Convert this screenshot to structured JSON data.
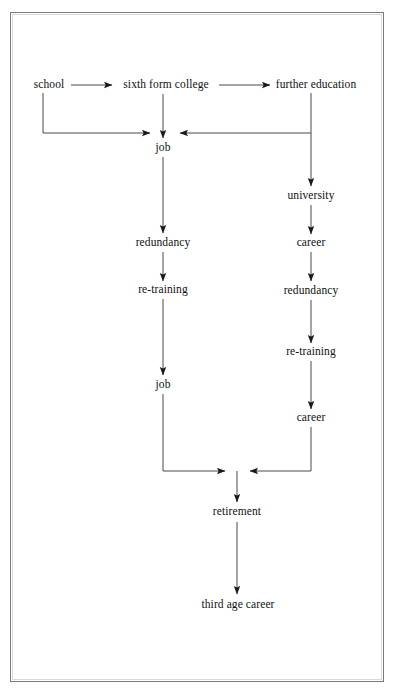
{
  "diagram": {
    "type": "flowchart",
    "background_color": "#ffffff",
    "border_color": "#7a7a7a",
    "line_color": "#222222",
    "text_color": "#111111",
    "nodes": [
      {
        "id": "school",
        "label": "school",
        "x": 49,
        "y": 85
      },
      {
        "id": "sixth-form",
        "label": "sixth form college",
        "x": 166,
        "y": 85
      },
      {
        "id": "further-education",
        "label": "further education",
        "x": 316,
        "y": 85
      },
      {
        "id": "job-1",
        "label": "job",
        "x": 163,
        "y": 148
      },
      {
        "id": "university",
        "label": "university",
        "x": 311,
        "y": 196
      },
      {
        "id": "redundancy-1",
        "label": "redundancy",
        "x": 163,
        "y": 243
      },
      {
        "id": "career-1",
        "label": "career",
        "x": 311,
        "y": 243
      },
      {
        "id": "re-training-1",
        "label": "re-training",
        "x": 163,
        "y": 290
      },
      {
        "id": "redundancy-2",
        "label": "redundancy",
        "x": 311,
        "y": 291
      },
      {
        "id": "re-training-2",
        "label": "re-training",
        "x": 311,
        "y": 352
      },
      {
        "id": "job-2",
        "label": "job",
        "x": 163,
        "y": 385
      },
      {
        "id": "career-2",
        "label": "career",
        "x": 311,
        "y": 418
      },
      {
        "id": "retirement",
        "label": "retirement",
        "x": 237,
        "y": 512
      },
      {
        "id": "third-age-career",
        "label": "third age career",
        "x": 238,
        "y": 605
      }
    ],
    "edges": [
      {
        "id": "school-to-sixth-form",
        "from": "school",
        "to": "sixth-form",
        "kind": "horizontal-right"
      },
      {
        "id": "sixth-form-to-further-education",
        "from": "sixth-form",
        "to": "further-education",
        "kind": "horizontal-right"
      },
      {
        "id": "school-to-job",
        "from": "school",
        "to": "job-1",
        "kind": "down-then-right"
      },
      {
        "id": "sixth-form-to-job",
        "from": "sixth-form",
        "to": "job-1",
        "kind": "vertical-down"
      },
      {
        "id": "further-education-to-job",
        "from": "further-education",
        "to": "job-1",
        "kind": "down-then-left"
      },
      {
        "id": "further-education-to-university",
        "from": "further-education",
        "to": "university",
        "kind": "vertical-down"
      },
      {
        "id": "job-to-redundancy",
        "from": "job-1",
        "to": "redundancy-1",
        "kind": "vertical-down"
      },
      {
        "id": "redundancy-to-re-training",
        "from": "redundancy-1",
        "to": "re-training-1",
        "kind": "vertical-down"
      },
      {
        "id": "re-training-to-job",
        "from": "re-training-1",
        "to": "job-2",
        "kind": "vertical-down"
      },
      {
        "id": "university-to-career",
        "from": "university",
        "to": "career-1",
        "kind": "vertical-down"
      },
      {
        "id": "career-to-redundancy",
        "from": "career-1",
        "to": "redundancy-2",
        "kind": "vertical-down"
      },
      {
        "id": "redundancy-to-re-training-right",
        "from": "redundancy-2",
        "to": "re-training-2",
        "kind": "vertical-down"
      },
      {
        "id": "re-training-to-career-right",
        "from": "re-training-2",
        "to": "career-2",
        "kind": "vertical-down"
      },
      {
        "id": "job2-to-junction",
        "from": "job-2",
        "to": "retirement",
        "kind": "down-then-right"
      },
      {
        "id": "career2-to-junction",
        "from": "career-2",
        "to": "retirement",
        "kind": "down-then-left"
      },
      {
        "id": "junction-to-retirement",
        "from": "junction",
        "to": "retirement",
        "kind": "vertical-down"
      },
      {
        "id": "retirement-to-third-age-career",
        "from": "retirement",
        "to": "third-age-career",
        "kind": "vertical-down"
      }
    ]
  }
}
